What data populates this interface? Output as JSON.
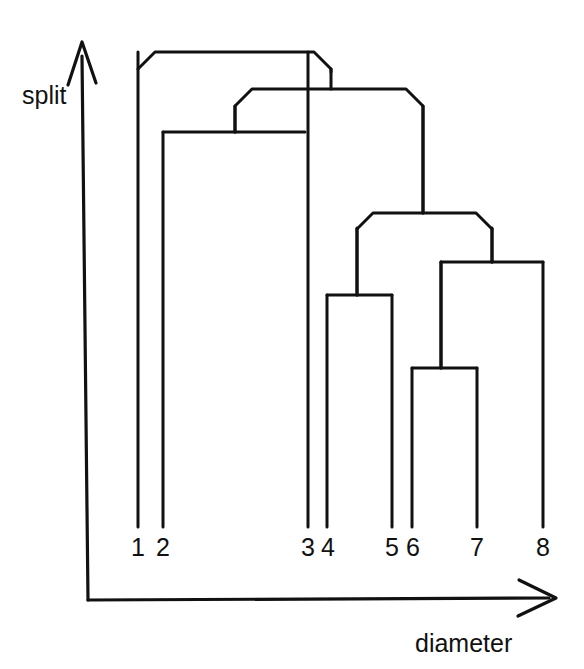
{
  "figure": {
    "title": "",
    "stroke_color": "#111111",
    "background_color": "#ffffff",
    "width": 584,
    "height": 669
  },
  "axes": {
    "y_axis": {
      "label": "split",
      "name": "split-axis",
      "arrow": "up",
      "x": 82,
      "top_y": 42,
      "bottom_y": 600,
      "label_x": 22,
      "label_y": 104
    },
    "x_axis": {
      "label": "diameter",
      "name": "diameter-axis",
      "arrow": "right",
      "y": 600,
      "left_x": 88,
      "right_x": 555,
      "label_x": 415,
      "label_y": 652
    }
  },
  "chart_data": {
    "type": "dendrogram",
    "title": "",
    "xlabel": "diameter",
    "ylabel": "split",
    "grid": false,
    "legend": null,
    "note": "Hierarchical clustering dendrogram drawn with bracket/chamfered links; height axis (split) increases upward, leaves along diameter axis.",
    "leaves": [
      {
        "label": "1",
        "x": 138,
        "tip_y": 527,
        "label_x": 138,
        "label_y": 556
      },
      {
        "label": "2",
        "x": 163,
        "tip_y": 527,
        "label_x": 163,
        "label_y": 556
      },
      {
        "label": "3",
        "x": 308,
        "tip_y": 527,
        "label_x": 308,
        "label_y": 556
      },
      {
        "label": "4",
        "x": 327,
        "tip_y": 527,
        "label_x": 328,
        "label_y": 556
      },
      {
        "label": "5",
        "x": 392,
        "tip_y": 527,
        "label_x": 392,
        "label_y": 556
      },
      {
        "label": "6",
        "x": 412,
        "tip_y": 527,
        "label_x": 413,
        "label_y": 556
      },
      {
        "label": "7",
        "x": 477,
        "tip_y": 527,
        "label_x": 477,
        "label_y": 556
      },
      {
        "label": "8",
        "x": 543,
        "tip_y": 527,
        "label_x": 543,
        "label_y": 556
      }
    ],
    "merges": [
      {
        "id": "m1",
        "name": "merge-7-8",
        "members": [
          "7",
          "8"
        ],
        "left_x": 441,
        "right_x": 543,
        "y": 262,
        "chamfer": 0,
        "stem_x": 492,
        "stem_to_y": 228
      },
      {
        "id": "m2",
        "name": "merge-5-6",
        "members": [
          "5",
          "6"
        ],
        "left_x": 412,
        "right_x": 477,
        "y": 368,
        "chamfer": 0,
        "stem_x": 441,
        "stem_to_y": 262
      },
      {
        "id": "m3",
        "name": "merge-3-4",
        "members": [
          "3",
          "4"
        ],
        "left_x": 327,
        "right_x": 392,
        "y": 295,
        "chamfer": 0,
        "stem_x": 357,
        "stem_to_y": 228
      },
      {
        "id": "m4",
        "name": "merge-56-78",
        "members": [
          "5",
          "6",
          "7",
          "8"
        ],
        "left_x": 357,
        "right_x": 492,
        "y": 213,
        "chamfer": 16,
        "stem_x": 423,
        "stem_to_y": 107
      },
      {
        "id": "m5",
        "name": "merge-2-3",
        "members": [
          "2",
          "3"
        ],
        "left_x": 163,
        "right_x": 305,
        "y": 132,
        "chamfer": 0,
        "stem_x": 235,
        "stem_to_y": 107
      },
      {
        "id": "m6",
        "name": "merge-inner-right",
        "members": [
          "2",
          "3",
          "5",
          "6",
          "7",
          "8"
        ],
        "left_x": 235,
        "right_x": 423,
        "y": 89,
        "chamfer": 17,
        "stem_x": 331,
        "stem_to_y": 70
      },
      {
        "id": "m7",
        "name": "merge-root",
        "members": [
          "1",
          "2",
          "3",
          "5",
          "6",
          "7",
          "8"
        ],
        "left_x": 138,
        "right_x": 331,
        "y": 52,
        "chamfer": 17,
        "stem_x": null,
        "stem_to_y": null
      }
    ],
    "leaf_count": 8,
    "merge_count": 7,
    "axis_ranges": {
      "x": "unlabeled (diameter, increasing right)",
      "y": "unlabeled (split, increasing up)"
    }
  }
}
